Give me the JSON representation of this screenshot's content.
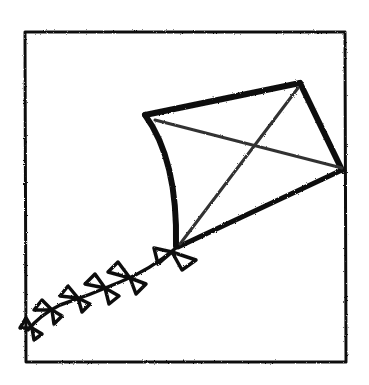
{
  "illustration": {
    "subject": "kite",
    "style": "hand-drawn crayon sketch",
    "colors": {
      "ink": "#111111",
      "background": "#ffffff"
    }
  }
}
